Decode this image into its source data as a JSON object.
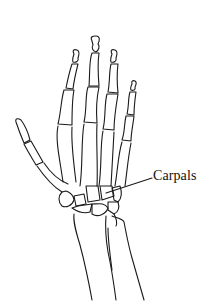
{
  "figure": {
    "labels": [
      {
        "text": "Carpals",
        "target": "carpal-bones"
      }
    ],
    "colors": {
      "line": "#1a1a1a",
      "background": "#ffffff"
    }
  }
}
